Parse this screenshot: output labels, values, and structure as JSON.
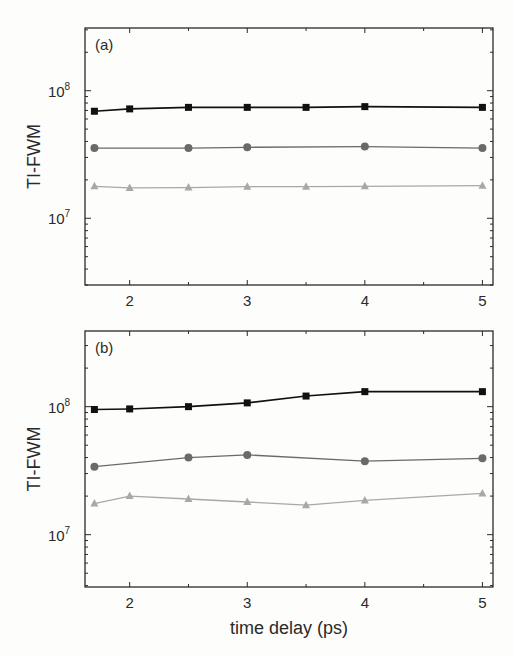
{
  "chart_data": [
    {
      "type": "line",
      "panel_label": "(a)",
      "title": "",
      "xlabel": "",
      "ylabel": "TI-FWM",
      "yscale": "log",
      "xlim": [
        1.62,
        5.09
      ],
      "ylim": [
        3000000.0,
        310000000.0
      ],
      "xticks": [
        2,
        3,
        4,
        5
      ],
      "xtick_labels": [
        "2",
        "3",
        "4",
        "5"
      ],
      "yticks": [
        10000000.0,
        100000000.0
      ],
      "ytick_labels": [
        {
          "base": "10",
          "exp": "7"
        },
        {
          "base": "10",
          "exp": "8"
        }
      ],
      "grid": false,
      "legend": "none",
      "series": [
        {
          "name": "squares",
          "marker": "square",
          "color": "#111111",
          "x": [
            1.7,
            2,
            2.5,
            3,
            3.5,
            4,
            5
          ],
          "y": [
            69000000.0,
            72000000.0,
            74000000.0,
            74000000.0,
            74000000.0,
            75000000.0,
            74000000.0
          ]
        },
        {
          "name": "circles",
          "marker": "circle",
          "color": "#6a6a6a",
          "x": [
            1.7,
            2.5,
            3,
            4,
            5
          ],
          "y": [
            35500000.0,
            35500000.0,
            36000000.0,
            36500000.0,
            35500000.0
          ]
        },
        {
          "name": "triangles",
          "marker": "triangle",
          "color": "#a8a8a8",
          "x": [
            1.7,
            2,
            2.5,
            3,
            3.5,
            4,
            5
          ],
          "y": [
            17800000.0,
            17300000.0,
            17400000.0,
            17700000.0,
            17700000.0,
            17800000.0,
            18000000.0
          ]
        }
      ]
    },
    {
      "type": "line",
      "panel_label": "(b)",
      "title": "",
      "xlabel": "time delay (ps)",
      "ylabel": "TI-FWM",
      "yscale": "log",
      "xlim": [
        1.62,
        5.09
      ],
      "ylim": [
        3900000.0,
        390000000.0
      ],
      "xticks": [
        2,
        3,
        4,
        5
      ],
      "xtick_labels": [
        "2",
        "3",
        "4",
        "5"
      ],
      "yticks": [
        10000000.0,
        100000000.0
      ],
      "ytick_labels": [
        {
          "base": "10",
          "exp": "7"
        },
        {
          "base": "10",
          "exp": "8"
        }
      ],
      "grid": false,
      "legend": "none",
      "series": [
        {
          "name": "squares",
          "marker": "square",
          "color": "#111111",
          "x": [
            1.7,
            2,
            2.5,
            3,
            3.5,
            4,
            5
          ],
          "y": [
            95000000.0,
            96000000.0,
            100000000.0,
            107000000.0,
            121000000.0,
            131000000.0,
            131000000.0
          ]
        },
        {
          "name": "circles",
          "marker": "circle",
          "color": "#6a6a6a",
          "x": [
            1.7,
            2.5,
            3,
            4,
            5
          ],
          "y": [
            34000000.0,
            40000000.0,
            42000000.0,
            37500000.0,
            39500000.0
          ]
        },
        {
          "name": "triangles",
          "marker": "triangle",
          "color": "#a8a8a8",
          "x": [
            1.7,
            2,
            2.5,
            3,
            3.5,
            4,
            5
          ],
          "y": [
            17500000.0,
            20000000.0,
            19000000.0,
            18000000.0,
            17000000.0,
            18500000.0,
            21000000.0
          ]
        }
      ]
    }
  ]
}
